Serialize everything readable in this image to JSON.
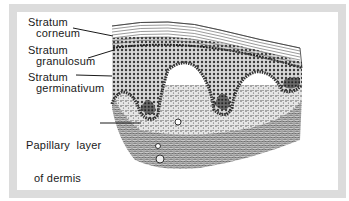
{
  "diagram": {
    "labels": [
      {
        "id": "stratum-corneum",
        "line1": "Stratum",
        "line2": "corneum"
      },
      {
        "id": "stratum-granulosum",
        "line1": "Stratum",
        "line2": "granulosum"
      },
      {
        "id": "stratum-germinativum",
        "line1": "Stratum",
        "line2": "germinativum"
      },
      {
        "id": "papillary-layer",
        "line1": "Papillary  layer",
        "line2": "of dermis"
      }
    ],
    "colors": {
      "frame": "#dcdcdc",
      "ink": "#1a1a1a",
      "background": "#ffffff"
    }
  }
}
